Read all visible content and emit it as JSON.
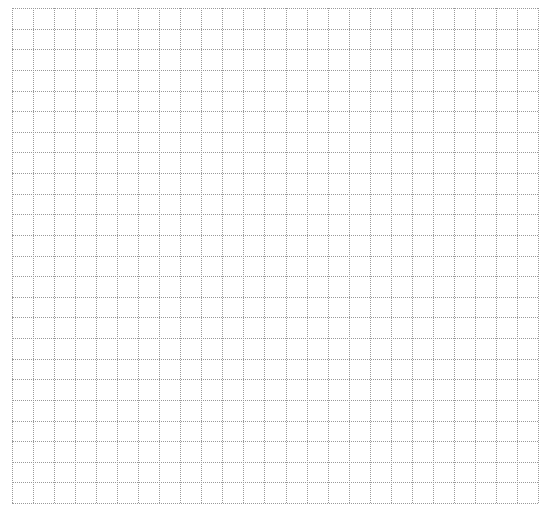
{
  "grid": {
    "columns": 25,
    "rows": 24,
    "line_style": "dotted",
    "line_color": "#9a9a9a",
    "background_color": "#ffffff"
  }
}
